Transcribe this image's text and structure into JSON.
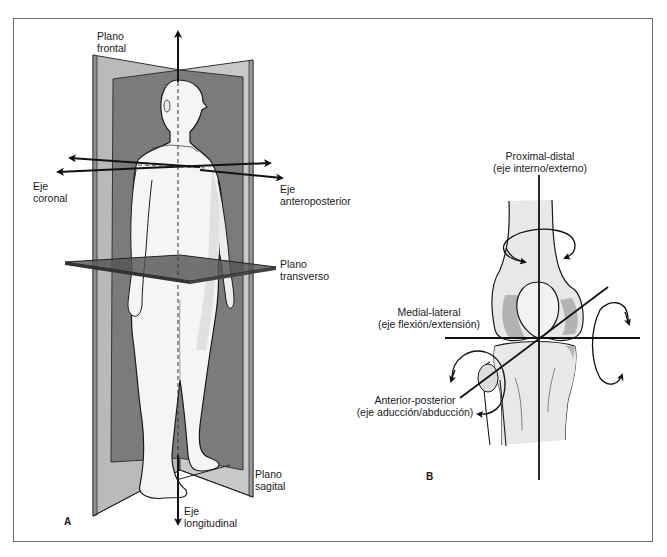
{
  "figure": {
    "panel_a": {
      "letter": "A",
      "labels": {
        "plano_frontal": [
          "Plano",
          "frontal"
        ],
        "eje_coronal": [
          "Eje",
          "coronal"
        ],
        "eje_anteroposterior": [
          "Eje",
          "anteroposterior"
        ],
        "plano_transverso": [
          "Plano",
          "transverso"
        ],
        "plano_sagital": [
          "Plano",
          "sagital"
        ],
        "eje_longitudinal": [
          "Eje",
          "longitudinal"
        ]
      }
    },
    "panel_b": {
      "letter": "B",
      "labels": {
        "proximal_distal": [
          "Proximal-distal",
          "(eje interno/externo)"
        ],
        "medial_lateral": [
          "Medial-lateral",
          "(eje flexión/extensión)"
        ],
        "anterior_posterior": [
          "Anterior-posterior",
          "(eje aducción/abducción)"
        ]
      }
    },
    "colors": {
      "plane_light": "#b8b8b8",
      "plane_dark": "#7a7a7a",
      "transverse_plane": "#555555",
      "body_fill": "#f4f4f4",
      "bone_fill": "#e6e6e6",
      "bone_shadow": "#b0b0b0",
      "line": "#111111",
      "border": "#6e6e6e"
    }
  }
}
